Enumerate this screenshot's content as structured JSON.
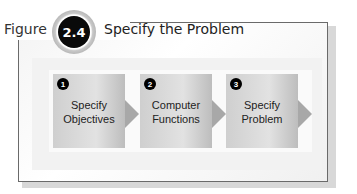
{
  "figure": {
    "label": "Figure",
    "number": "2.4",
    "title": "Specify the Problem"
  },
  "steps": [
    {
      "number": "1",
      "line1": "Specify",
      "line2": "Objectives"
    },
    {
      "number": "2",
      "line1": "Computer",
      "line2": "Functions"
    },
    {
      "number": "3",
      "line1": "Specify",
      "line2": "Problem"
    }
  ]
}
